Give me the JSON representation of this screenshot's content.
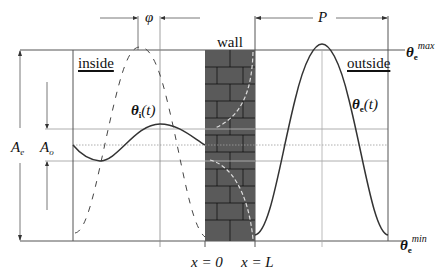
{
  "diagram": {
    "labels": {
      "inside": "inside",
      "outside": "outside",
      "wall": "wall",
      "phi": "φ",
      "period": "P",
      "x_zero": "x = 0",
      "x_L": "x = L",
      "amp_outside": "A",
      "amp_outside_sub": "e",
      "amp_inside": "A",
      "amp_inside_sub": "o",
      "theta_inside": "θ",
      "theta_inside_sub": "i",
      "theta_inside_arg": "(t)",
      "theta_outside": "θ",
      "theta_outside_sub": "e",
      "theta_outside_arg": "(t)",
      "theta_max": "θ",
      "theta_max_sub": "e",
      "theta_max_sup": "max",
      "theta_min": "θ",
      "theta_min_sub": "e",
      "theta_min_sup": "min"
    },
    "colors": {
      "line": "#333333",
      "grid": "#999999",
      "wall_fill": "#555555",
      "brick_line": "#111111",
      "profile_dash": "#dddddd"
    }
  }
}
